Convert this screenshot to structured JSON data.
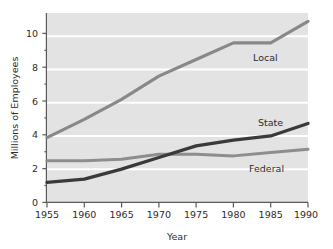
{
  "chart_data": {
    "type": "line",
    "title": "",
    "xlabel": "Year",
    "ylabel": "Millions of Employees",
    "x": [
      1955,
      1960,
      1965,
      1970,
      1975,
      1980,
      1985,
      1990
    ],
    "xticklabels": [
      "1955",
      "1960",
      "1965",
      "1970",
      "1975",
      "1980",
      "1985",
      "1990"
    ],
    "yticklabels": [
      "0",
      "2",
      "4",
      "6",
      "8",
      "10"
    ],
    "yticks": [
      0,
      2,
      4,
      6,
      8,
      10
    ],
    "xlim": [
      1955,
      1990
    ],
    "ylim": [
      0,
      11.4
    ],
    "grid": "horizontal-white-gridlines",
    "legend_position": "inline-right-of-each-series",
    "plot_background": "#e3e3e3",
    "gridline_color": "#ffffff",
    "series": [
      {
        "name": "Local",
        "label": "Local",
        "color": "#888888",
        "values": [
          3.9,
          5.0,
          6.2,
          7.6,
          8.6,
          9.6,
          9.6,
          10.9
        ]
      },
      {
        "name": "State",
        "label": "State",
        "color": "#3a3a3a",
        "values": [
          1.2,
          1.4,
          2.0,
          2.7,
          3.4,
          3.75,
          4.0,
          4.75
        ]
      },
      {
        "name": "Federal",
        "label": "Federal",
        "color": "#8d8d8d",
        "values": [
          2.5,
          2.5,
          2.6,
          2.9,
          2.9,
          2.8,
          3.0,
          3.2
        ]
      }
    ]
  },
  "axes": {
    "y_title": "Millions of Employees",
    "x_title": "Year",
    "y_ticks": [
      "10",
      "8",
      "6",
      "4",
      "2",
      "0"
    ],
    "x_ticks": [
      "1955",
      "1960",
      "1965",
      "1970",
      "1975",
      "1980",
      "1985",
      "1990"
    ]
  },
  "labels": {
    "local": "Local",
    "state": "State",
    "federal": "Federal"
  },
  "colors": {
    "local_line": "#888888",
    "state_line": "#3a3a3a",
    "federal_line": "#8d8d8d",
    "plot_bg": "#e3e3e3",
    "gridline": "#ffffff",
    "axis": "#5a5a5a",
    "text": "#2b2b2b"
  }
}
